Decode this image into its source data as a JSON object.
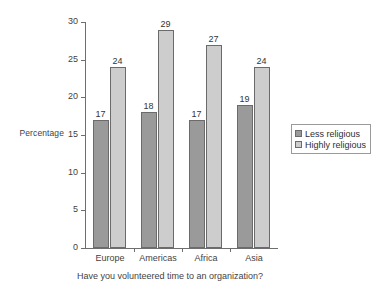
{
  "chart_data": {
    "type": "bar",
    "title": "",
    "subtitle": "",
    "xlabel": "Have you volunteered time to an organization?",
    "ylabel": "Percentage",
    "categories": [
      "Europe",
      "Americas",
      "Africa",
      "Asia"
    ],
    "series": [
      {
        "name": "Less religious",
        "values": [
          17,
          18,
          17,
          19
        ],
        "color": "#9a9a9a"
      },
      {
        "name": "Highly religious",
        "values": [
          24,
          29,
          27,
          24
        ],
        "color": "#cdcdcd"
      }
    ],
    "ylim": [
      0,
      30
    ],
    "yticks": [
      0,
      5,
      10,
      15,
      20,
      25,
      30
    ],
    "ytick_labels": [
      "0",
      "5",
      "10",
      "15",
      "20",
      "25",
      "30"
    ],
    "grid": false,
    "legend_position": "right",
    "data_labels": true
  },
  "axes": {
    "y_title": "Percentage",
    "x_caption": "Have you volunteered time to an organization?"
  },
  "legend": {
    "entries": [
      {
        "label": "Less religious"
      },
      {
        "label": "Highly religious"
      }
    ]
  }
}
